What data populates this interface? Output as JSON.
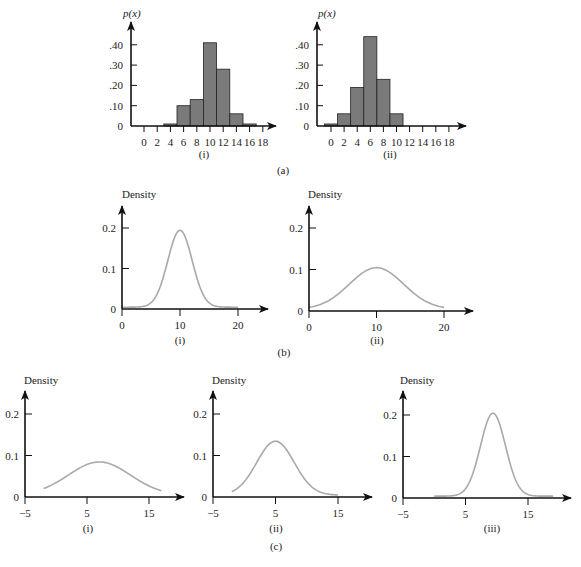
{
  "figure_labels": {
    "a": "(a)",
    "b": "(b)",
    "c": "(c)"
  },
  "colors": {
    "axis": "#111111",
    "bar_fill": "#7a7a7a",
    "bar_stroke": "#222222",
    "curve": "#a9a9a9"
  },
  "chart_data": [
    {
      "id": "a-i",
      "type": "bar",
      "panel": "(a)",
      "sublabel": "(i)",
      "ylabel": "p(x)",
      "xlabel": "",
      "categories": [
        4,
        6,
        8,
        10,
        12,
        14,
        16
      ],
      "values": [
        0.01,
        0.1,
        0.13,
        0.41,
        0.28,
        0.06,
        0.01
      ],
      "bin_width": 2,
      "x_ticks": [
        "0",
        "2",
        "4",
        "6",
        "8",
        "10",
        "12",
        "14",
        "16",
        "18"
      ],
      "y_ticks": [
        "0",
        ".10",
        ".20",
        ".30",
        ".40"
      ],
      "ylim": [
        0,
        0.45
      ],
      "grid": false
    },
    {
      "id": "a-ii",
      "type": "bar",
      "panel": "(a)",
      "sublabel": "(ii)",
      "ylabel": "p(x)",
      "xlabel": "",
      "categories": [
        0,
        2,
        4,
        6,
        8,
        10
      ],
      "values": [
        0.01,
        0.06,
        0.19,
        0.44,
        0.23,
        0.06
      ],
      "bin_width": 2,
      "x_ticks": [
        "0",
        "2",
        "4",
        "6",
        "8",
        "10",
        "12",
        "14",
        "16",
        "18"
      ],
      "y_ticks": [
        "0",
        ".10",
        ".20",
        ".30",
        ".40"
      ],
      "ylim": [
        0,
        0.45
      ],
      "grid": false
    },
    {
      "id": "b-i",
      "type": "line",
      "panel": "(b)",
      "sublabel": "(i)",
      "ylabel": "Density",
      "distribution": "normal",
      "mean": 10,
      "sd": 2.1,
      "peak": 0.19,
      "x_range": [
        0,
        20
      ],
      "x_ticks": [
        "0",
        "10",
        "20"
      ],
      "y_ticks": [
        "0",
        "0.1",
        "0.2"
      ],
      "ylim": [
        0,
        0.25
      ],
      "grid": false
    },
    {
      "id": "b-ii",
      "type": "line",
      "panel": "(b)",
      "sublabel": "(ii)",
      "ylabel": "Density",
      "distribution": "normal",
      "mean": 10,
      "sd": 4,
      "peak": 0.1,
      "x_range": [
        0,
        20
      ],
      "x_ticks": [
        "0",
        "10",
        "20"
      ],
      "y_ticks": [
        "0",
        "0.1",
        "0.2"
      ],
      "ylim": [
        0,
        0.25
      ],
      "grid": false
    },
    {
      "id": "c-i",
      "type": "line",
      "panel": "(c)",
      "sublabel": "(i)",
      "ylabel": "Density",
      "distribution": "normal",
      "mean": 7,
      "sd": 5,
      "peak": 0.08,
      "x_range": [
        -2,
        17
      ],
      "x_ticks": [
        "−5",
        "5",
        "15"
      ],
      "y_ticks": [
        "0",
        "0.1",
        "0.2"
      ],
      "ylim": [
        0,
        0.25
      ],
      "grid": false
    },
    {
      "id": "c-ii",
      "type": "line",
      "panel": "(c)",
      "sublabel": "(ii)",
      "ylabel": "Density",
      "distribution": "normal",
      "mean": 5,
      "sd": 3,
      "peak": 0.13,
      "x_range": [
        -2,
        15
      ],
      "x_ticks": [
        "−5",
        "5",
        "15"
      ],
      "y_ticks": [
        "0",
        "0.1",
        "0.2"
      ],
      "ylim": [
        0,
        0.25
      ],
      "grid": false
    },
    {
      "id": "c-iii",
      "type": "line",
      "panel": "(c)",
      "sublabel": "(iii)",
      "ylabel": "Density",
      "distribution": "normal",
      "mean": 9.4,
      "sd": 2,
      "peak": 0.2,
      "x_range": [
        0,
        19
      ],
      "x_ticks": [
        "−5",
        "5",
        "15"
      ],
      "y_ticks": [
        "0",
        "0.1",
        "0.2"
      ],
      "ylim": [
        0,
        0.25
      ],
      "grid": false
    }
  ]
}
